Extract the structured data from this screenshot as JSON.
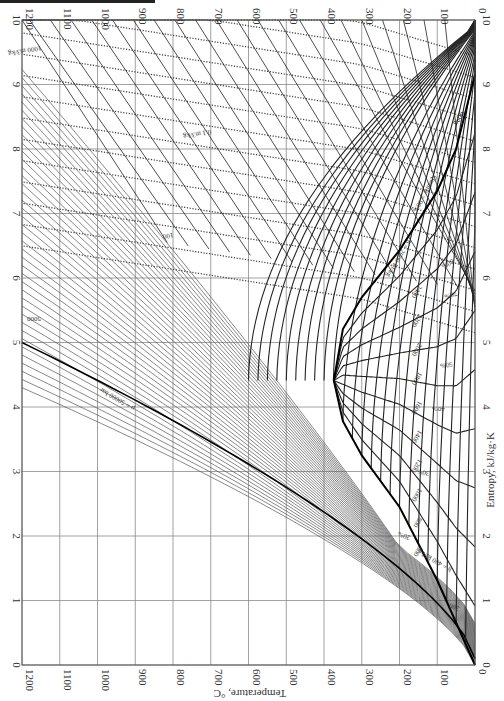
{
  "chart_data": {
    "type": "line",
    "orientation": "rotated 90deg clockwise (text appears upside-down); temperature axis horizontal increasing right-to-left, entropy axis vertical increasing bottom-to-top",
    "xlabel": "Temperature, °C",
    "ylabel": "Entropy, kJ/kg·K",
    "xlim": [
      0,
      1200
    ],
    "ylim": [
      0,
      10
    ],
    "grid": true,
    "temperature_ticks": [
      "0",
      "100",
      "200",
      "300",
      "400",
      "500",
      "600",
      "700",
      "800",
      "900",
      "1000",
      "1100",
      "1200"
    ],
    "entropy_ticks": [
      "0",
      "1",
      "2",
      "3",
      "4",
      "5",
      "6",
      "7",
      "8",
      "9",
      "10"
    ],
    "saturation_dome": {
      "label": "Saturated liquid / saturated vapor",
      "critical_point": {
        "s": 4.41,
        "T": 374
      },
      "points": [
        {
          "s": 0.0,
          "T": 0
        },
        {
          "s": 1.31,
          "T": 100
        },
        {
          "s": 2.45,
          "T": 200
        },
        {
          "s": 3.25,
          "T": 300
        },
        {
          "s": 3.78,
          "T": 350
        },
        {
          "s": 4.41,
          "T": 374
        },
        {
          "s": 5.21,
          "T": 350
        },
        {
          "s": 5.7,
          "T": 300
        },
        {
          "s": 6.43,
          "T": 200
        },
        {
          "s": 7.35,
          "T": 100
        },
        {
          "s": 8.0,
          "T": 50
        },
        {
          "s": 9.16,
          "T": 0
        }
      ]
    },
    "quality_lines": {
      "label": "Quality",
      "values": [
        "10%",
        "20%",
        "30%",
        "40%",
        "50%",
        "60%",
        "70%",
        "80%",
        "90%"
      ]
    },
    "enthalpy_lines": {
      "unit": "kJ/kg",
      "labels": [
        "h = 400 kJ/kg",
        "200",
        "600",
        "800",
        "1000",
        "1200",
        "1400",
        "1600",
        "1800",
        "2000",
        "2200",
        "2400",
        "h = 2600 kJ/kg",
        "2800",
        "3000",
        "3200",
        "3400",
        "3600",
        "3800",
        "4000",
        "4200",
        "4400",
        "4600",
        "4800",
        "5000",
        "h = 5000 kJ/kg"
      ]
    },
    "pressure_lines": {
      "unit": "bar",
      "labels": [
        "p = 50000 bar",
        "30000",
        "20000",
        "10000",
        "5000",
        "2000",
        "1000",
        "500",
        "221.2 (critical)",
        "100",
        "50",
        "20",
        "10",
        "5",
        "2",
        "1",
        "0.5",
        "0.1",
        "0.05",
        "0.01",
        "0.006113"
      ]
    },
    "specific_volume_lines": {
      "unit": "m3/kg",
      "style": "dotted",
      "labels": [
        "0.001",
        "0.01",
        "0.1 m3/kg",
        "1.0",
        "10",
        "100",
        "1000 m3/kg"
      ]
    },
    "annotations": [
      "Quality = 90%",
      "h = 2600 kJ/kg",
      "h = 400 kJ/kg",
      "p = 50000 bar",
      "Saturated liquid",
      "Saturated vapor",
      "h = 5000 kJ/kg"
    ]
  },
  "axes": {
    "temperature_label": "Temperature, °C",
    "entropy_label": "Entropy, kJ/kg·K"
  }
}
